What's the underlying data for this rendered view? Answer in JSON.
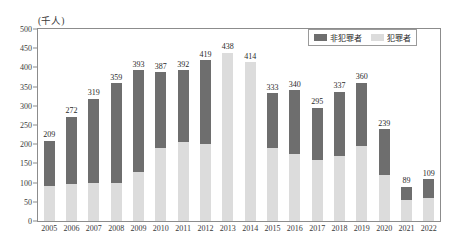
{
  "chart_data": {
    "type": "bar",
    "subtype": "stacked-bar",
    "title": "",
    "xlabel": "",
    "ylabel": "",
    "unit_label": "(千人)",
    "grid": false,
    "legend_position": "top-right",
    "ylim": [
      0,
      500
    ],
    "ytick_step": 50,
    "yticks": [
      500,
      450,
      400,
      350,
      300,
      250,
      200,
      150,
      100,
      50,
      0
    ],
    "categories": [
      "2005",
      "2006",
      "2007",
      "2008",
      "2009",
      "2010",
      "2011",
      "2012",
      "2013",
      "2014",
      "2015",
      "2016",
      "2017",
      "2018",
      "2019",
      "2020",
      "2021",
      "2022"
    ],
    "totals": [
      209,
      272,
      319,
      359,
      393,
      387,
      392,
      419,
      438,
      414,
      333,
      340,
      295,
      337,
      360,
      239,
      89,
      109
    ],
    "series": [
      {
        "name": "犯罪者",
        "color": "#dcdcdc",
        "values": [
          90,
          96,
          100,
          98,
          128,
          190,
          205,
          200,
          438,
          414,
          190,
          175,
          160,
          170,
          195,
          120,
          56,
          60
        ]
      },
      {
        "name": "非犯罪者",
        "color": "#6e6e6e",
        "values": [
          119,
          176,
          219,
          261,
          265,
          197,
          187,
          219,
          0,
          0,
          143,
          165,
          135,
          167,
          165,
          119,
          33,
          49
        ]
      }
    ],
    "data_labels": [
      "209",
      "272",
      "319",
      "359",
      "393",
      "387",
      "392",
      "419",
      "438",
      "414",
      "333",
      "340",
      "295",
      "337",
      "360",
      "239",
      "89",
      "109"
    ]
  },
  "legend": {
    "items": [
      {
        "label": "非犯罪者",
        "swatch": "dark"
      },
      {
        "label": "犯罪者",
        "swatch": "light"
      }
    ]
  },
  "colors": {
    "dark_gray": "#6e6e6e",
    "light_gray": "#dcdcdc",
    "axis": "#8c8c8c",
    "text": "#2a2a2a",
    "background": "#ffffff"
  }
}
